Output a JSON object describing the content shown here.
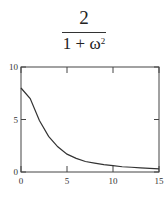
{
  "formula": {
    "numerator": "2",
    "denominator_base": "1 + ω",
    "denominator_exponent": "2"
  },
  "chart_data": {
    "type": "line",
    "title": "",
    "xlabel": "",
    "ylabel": "",
    "xlim": [
      0,
      15
    ],
    "ylim": [
      0,
      10
    ],
    "x_ticks": [
      "0",
      "5",
      "10",
      "15"
    ],
    "y_ticks": [
      "0",
      "5",
      "10"
    ],
    "grid": false,
    "series": [
      {
        "name": "curve",
        "x": [
          0,
          1,
          2,
          3,
          4,
          5,
          6,
          7,
          8,
          9,
          10,
          11,
          12,
          13,
          14,
          15
        ],
        "y": [
          8.0,
          7.0,
          4.9,
          3.4,
          2.4,
          1.7,
          1.3,
          1.0,
          0.85,
          0.7,
          0.6,
          0.5,
          0.45,
          0.4,
          0.35,
          0.3
        ]
      }
    ],
    "colors": {
      "line": "#333333",
      "frame": "#444444"
    }
  }
}
